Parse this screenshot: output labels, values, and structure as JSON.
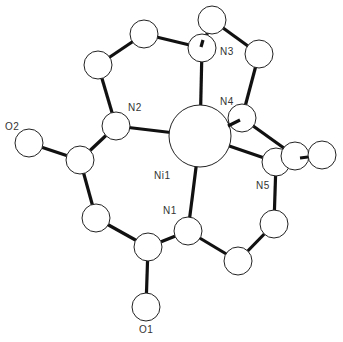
{
  "figure": {
    "type": "ORTEP-style molecular structure diagram",
    "central_atom": "Ni1",
    "colors": {
      "bond": "#111111",
      "atom_fill": "#ffffff",
      "atom_stroke": "#222222",
      "label": "#333333"
    }
  },
  "atoms": [
    {
      "id": "Ni1",
      "label": "Ni1",
      "x": 200,
      "y": 136,
      "r": 31,
      "show_label": true,
      "lx": 154,
      "ly": 179
    },
    {
      "id": "N1",
      "label": "N1",
      "x": 188,
      "y": 231,
      "r": 14,
      "show_label": true,
      "lx": 163,
      "ly": 214
    },
    {
      "id": "N2",
      "label": "N2",
      "x": 116,
      "y": 126,
      "r": 14,
      "show_label": true,
      "lx": 128,
      "ly": 111
    },
    {
      "id": "N3",
      "label": "N3",
      "x": 202,
      "y": 48,
      "r": 14,
      "show_label": true,
      "lx": 220,
      "ly": 55
    },
    {
      "id": "N4",
      "label": "N4",
      "x": 242,
      "y": 118,
      "r": 14,
      "show_label": true,
      "lx": 220,
      "ly": 105
    },
    {
      "id": "N5",
      "label": "N5",
      "x": 276,
      "y": 162,
      "r": 14,
      "show_label": true,
      "lx": 256,
      "ly": 189
    },
    {
      "id": "O1",
      "label": "O1",
      "x": 146,
      "y": 307,
      "r": 14,
      "show_label": true,
      "lx": 139,
      "ly": 333
    },
    {
      "id": "O2",
      "label": "O2",
      "x": 29,
      "y": 143,
      "r": 14,
      "show_label": true,
      "lx": 5,
      "ly": 130
    },
    {
      "id": "C1",
      "label": "",
      "x": 144,
      "y": 34,
      "r": 14,
      "show_label": false
    },
    {
      "id": "C2",
      "label": "",
      "x": 98,
      "y": 65,
      "r": 14,
      "show_label": false
    },
    {
      "id": "C3",
      "label": "",
      "x": 80,
      "y": 160,
      "r": 14,
      "show_label": false
    },
    {
      "id": "C4",
      "label": "",
      "x": 96,
      "y": 218,
      "r": 14,
      "show_label": false
    },
    {
      "id": "C5",
      "label": "",
      "x": 148,
      "y": 247,
      "r": 14,
      "show_label": false
    },
    {
      "id": "C6",
      "label": "",
      "x": 212,
      "y": 20,
      "r": 14,
      "show_label": false
    },
    {
      "id": "C7",
      "label": "",
      "x": 259,
      "y": 54,
      "r": 14,
      "show_label": false
    },
    {
      "id": "C8",
      "label": "",
      "x": 295,
      "y": 156,
      "r": 14,
      "show_label": false
    },
    {
      "id": "C9",
      "label": "",
      "x": 322,
      "y": 155,
      "r": 14,
      "show_label": false
    },
    {
      "id": "C10",
      "label": "",
      "x": 274,
      "y": 224,
      "r": 14,
      "show_label": false
    },
    {
      "id": "C11",
      "label": "",
      "x": 238,
      "y": 261,
      "r": 14,
      "show_label": false
    }
  ],
  "bonds": [
    [
      "C1",
      "C2"
    ],
    [
      "C2",
      "N2"
    ],
    [
      "N2",
      "C3"
    ],
    [
      "C3",
      "O2"
    ],
    [
      "C3",
      "C4"
    ],
    [
      "C4",
      "C5"
    ],
    [
      "C5",
      "O1"
    ],
    [
      "C5",
      "N1"
    ],
    [
      "N1",
      "Ni1"
    ],
    [
      "N2",
      "Ni1"
    ],
    [
      "C1",
      "N3"
    ],
    [
      "N3",
      "Ni1"
    ],
    [
      "N3",
      "C6"
    ],
    [
      "C6",
      "C7"
    ],
    [
      "C7",
      "N4"
    ],
    [
      "N4",
      "Ni1"
    ],
    [
      "N4",
      "C8"
    ],
    [
      "C8",
      "C9"
    ],
    [
      "Ni1",
      "N5"
    ],
    [
      "N5",
      "C10"
    ],
    [
      "C10",
      "C11"
    ],
    [
      "C11",
      "N1"
    ]
  ],
  "labels": {
    "Ni1": "Ni1",
    "N1": "N1",
    "N2": "N2",
    "N3": "N3",
    "N4": "N4",
    "N5": "N5",
    "O1": "O1",
    "O2": "O2"
  }
}
